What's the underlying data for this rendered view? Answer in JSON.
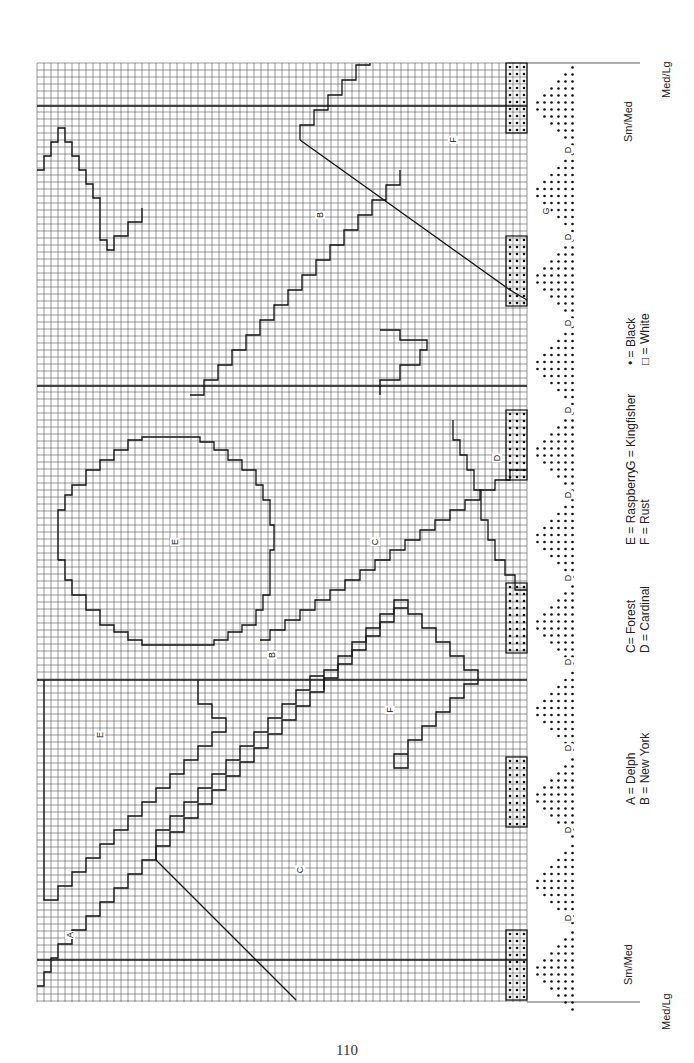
{
  "page": {
    "number": "110",
    "orientation": "rotated -90deg (landscape chart on portrait page)"
  },
  "grid": {
    "left": 37,
    "top": 63,
    "right": 527,
    "bottom": 1002,
    "cell": 7,
    "line_color": "#444444",
    "bold_rows_y": [
      106,
      386,
      680,
      960
    ]
  },
  "size_markers": {
    "top": [
      {
        "label": "Med/Lg",
        "x": 668,
        "y": 95
      },
      {
        "label": "Sm/Med",
        "x": 630,
        "y": 140
      }
    ],
    "bottom": [
      {
        "label": "Sm/Med",
        "x": 630,
        "y": 960
      },
      {
        "label": "Med/Lg",
        "x": 668,
        "y": 1000
      }
    ]
  },
  "legend": {
    "columns": [
      {
        "line1": "A = Delph",
        "line2": "B = New York"
      },
      {
        "line1": "C= Forest",
        "line2": "D = Cardinal"
      },
      {
        "line1": "E = Raspberry",
        "line2": "F = Rust"
      },
      {
        "line1": "G = Kingfisher",
        "line2": ""
      },
      {
        "line1": "• = Black",
        "line2": "□ = White"
      }
    ]
  },
  "region_labels": [
    {
      "letter": "A",
      "x": 70,
      "y": 935
    },
    {
      "letter": "C",
      "x": 300,
      "y": 870
    },
    {
      "letter": "E",
      "x": 100,
      "y": 735
    },
    {
      "letter": "F",
      "x": 390,
      "y": 710
    },
    {
      "letter": "B",
      "x": 272,
      "y": 655
    },
    {
      "letter": "E",
      "x": 175,
      "y": 542
    },
    {
      "letter": "C",
      "x": 375,
      "y": 542
    },
    {
      "letter": "D",
      "x": 497,
      "y": 458
    },
    {
      "letter": "G",
      "x": 545,
      "y": 211
    },
    {
      "letter": "B",
      "x": 320,
      "y": 215
    },
    {
      "letter": "F",
      "x": 453,
      "y": 140
    },
    {
      "letter": "D",
      "x": 568,
      "y": 918
    },
    {
      "letter": "D",
      "x": 568,
      "y": 830
    },
    {
      "letter": "D",
      "x": 568,
      "y": 748
    },
    {
      "letter": "D",
      "x": 568,
      "y": 662
    },
    {
      "letter": "D",
      "x": 568,
      "y": 578
    },
    {
      "letter": "D",
      "x": 568,
      "y": 495
    },
    {
      "letter": "D",
      "x": 568,
      "y": 410
    },
    {
      "letter": "D",
      "x": 568,
      "y": 323
    },
    {
      "letter": "D",
      "x": 568,
      "y": 237
    },
    {
      "letter": "D",
      "x": 568,
      "y": 150
    }
  ],
  "colors": {
    "background": "#ffffff",
    "grid": "#444444",
    "outline": "#111111",
    "dot": "#111111"
  }
}
